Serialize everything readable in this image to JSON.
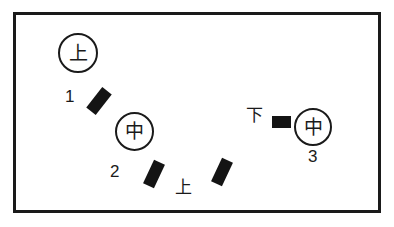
{
  "figure": {
    "type": "diagram",
    "frame": {
      "border_color": "#1a1a1a",
      "fill_color": "#ffffff",
      "border_width_px": 3
    },
    "nodes": [
      {
        "id": "node-1",
        "glyph": "上",
        "number_label": "1",
        "center": {
          "x": 75,
          "y": 50
        },
        "diameter_px": 40
      },
      {
        "id": "node-2",
        "glyph": "中",
        "number_label": "2",
        "center": {
          "x": 131,
          "y": 128
        },
        "diameter_px": 39
      },
      {
        "id": "node-3",
        "glyph": "中",
        "number_label": "3",
        "center": {
          "x": 310,
          "y": 124
        },
        "diameter_px": 38
      }
    ],
    "bars": [
      {
        "id": "bar-1",
        "orientation": "tilted",
        "angle_deg": 38,
        "color": "#141414"
      },
      {
        "id": "bar-2",
        "orientation": "tilted",
        "angle_deg": 25,
        "color": "#141414"
      },
      {
        "id": "bar-3",
        "orientation": "tilted",
        "angle_deg": 25,
        "color": "#141414"
      },
      {
        "id": "bar-4",
        "orientation": "horizontal",
        "angle_deg": 0,
        "color": "#141414"
      }
    ],
    "labels": {
      "number_1": "1",
      "number_2": "2",
      "number_3": "3",
      "kanji_ue_bottom": "上",
      "kanji_shita": "下"
    },
    "colors": {
      "ink": "#1a1a1a",
      "fill": "#141414",
      "background": "#ffffff"
    }
  }
}
